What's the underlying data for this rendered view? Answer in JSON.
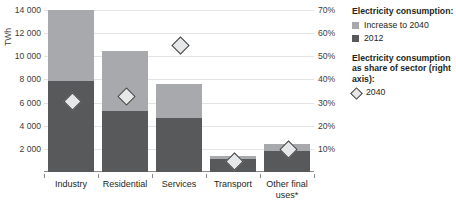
{
  "chart_data": {
    "type": "bar",
    "title": "",
    "subtitle": "",
    "xlabel": "",
    "ylabel": "TWh",
    "ylabel_right": "",
    "grid": true,
    "legend_position": "right",
    "categories": [
      "Industry",
      "Residential",
      "Services",
      "Transport",
      "Other final uses*"
    ],
    "ylim": [
      0,
      14000
    ],
    "yticks": [
      "2 000",
      "4 000",
      "6 000",
      "8 000",
      "10 000",
      "12 000",
      "14 000"
    ],
    "ytick_values": [
      2000,
      4000,
      6000,
      8000,
      10000,
      12000,
      14000
    ],
    "ylim_right": [
      0,
      70
    ],
    "yticks_right": [
      "10%",
      "20%",
      "30%",
      "40%",
      "50%",
      "60%",
      "70%"
    ],
    "ytick_values_right": [
      10,
      20,
      30,
      40,
      50,
      60,
      70
    ],
    "series": [
      {
        "name": "2012",
        "color": "#58595b",
        "values": [
          7900,
          5300,
          4700,
          1100,
          1800
        ]
      },
      {
        "name": "Increase to 2040",
        "color": "#a7a9ac",
        "values": [
          6100,
          5200,
          2900,
          300,
          600
        ]
      }
    ],
    "totals": [
      14000,
      10500,
      7600,
      1400,
      2400
    ],
    "markers": {
      "name": "2040",
      "axis": "right",
      "unit": "%",
      "values": [
        31,
        33,
        55,
        5,
        10
      ]
    }
  },
  "legend": {
    "title1": "Electricity consumption:",
    "item1": "Increase to 2040",
    "item2": "2012",
    "title2": "Electricity consumption as share of sector (right axis):",
    "item3": "2040"
  },
  "axes": {
    "left_title": "TWh"
  }
}
